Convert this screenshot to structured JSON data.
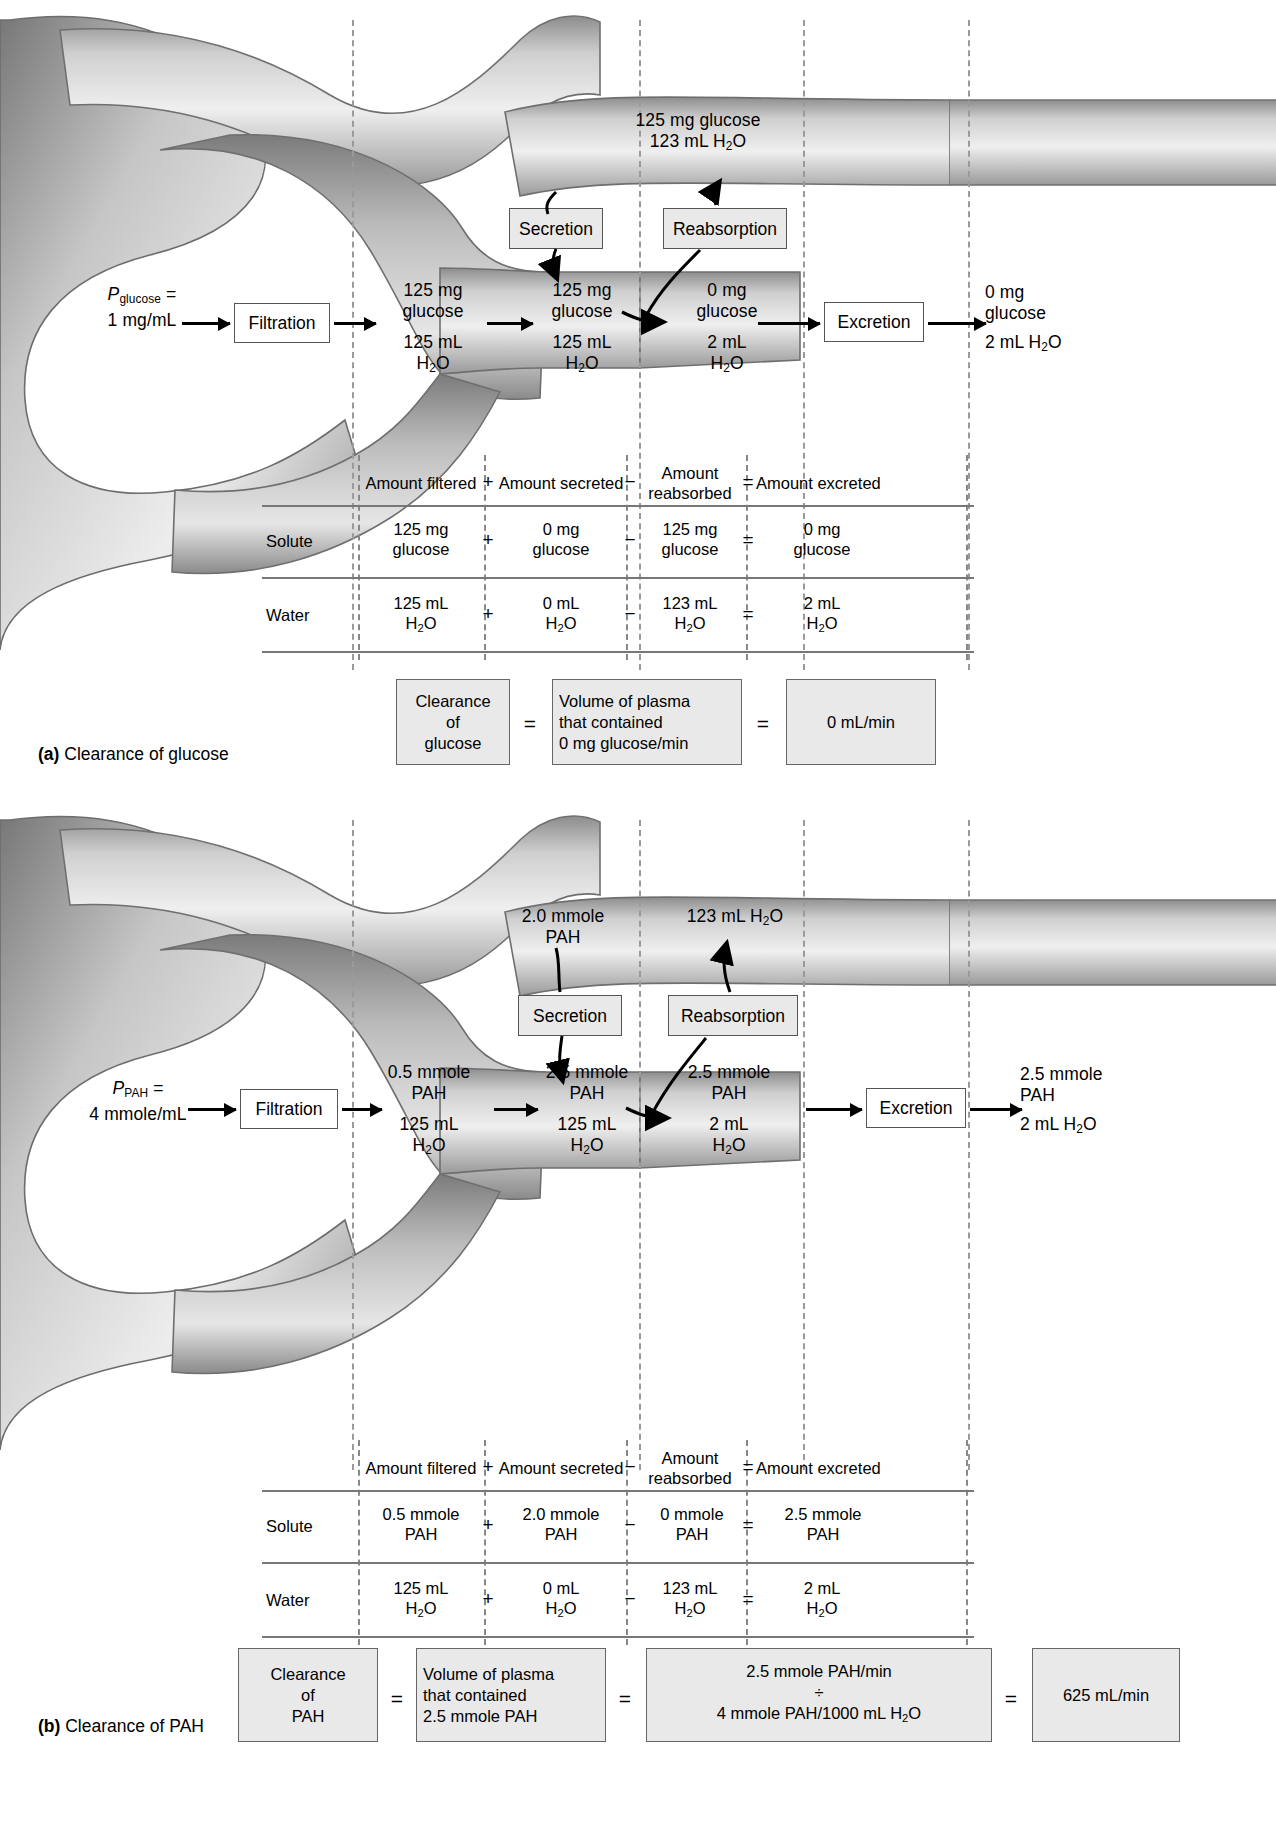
{
  "figure": {
    "type": "renal-clearance-diagram",
    "panels": [
      "a",
      "b"
    ]
  },
  "panel_a": {
    "caption_tag": "(a)",
    "caption_text": "Clearance of glucose",
    "plasma": {
      "symbol": "P",
      "subscript": "glucose",
      "equals": "=",
      "value": "1 mg/mL"
    },
    "process_boxes": {
      "filtration": "Filtration",
      "secretion": "Secretion",
      "reabsorption": "Reabsorption",
      "excretion": "Excretion"
    },
    "capillary_label": {
      "solute": "125 mg glucose",
      "water_pre": "123 mL H",
      "water_sub": "2",
      "water_post": "O"
    },
    "tubule_stages": [
      {
        "solute_amount": "125 mg",
        "solute_name": "glucose",
        "water_amount": "125 mL",
        "water_formula": "H2O"
      },
      {
        "solute_amount": "125 mg",
        "solute_name": "glucose",
        "water_amount": "125 mL",
        "water_formula": "H2O"
      },
      {
        "solute_amount": "0 mg",
        "solute_name": "glucose",
        "water_amount": "2 mL",
        "water_formula": "H2O"
      }
    ],
    "excreted": {
      "solute_amount": "0 mg",
      "solute_name": "glucose",
      "water": "2 mL H2O"
    },
    "table": {
      "headers": [
        "Amount filtered",
        "Amount secreted",
        "Amount\nreabsorbed",
        "Amount excreted"
      ],
      "header_filtered": "Amount filtered",
      "header_secreted": "Amount secreted",
      "header_reabsorbed_l1": "Amount",
      "header_reabsorbed_l2": "reabsorbed",
      "header_excreted": "Amount excreted",
      "operators": [
        "+",
        "−",
        "="
      ],
      "rows": [
        {
          "label": "Solute",
          "filtered_l1": "125 mg",
          "filtered_l2": "glucose",
          "secreted_l1": "0 mg",
          "secreted_l2": "glucose",
          "reabsorbed_l1": "125 mg",
          "reabsorbed_l2": "glucose",
          "excreted_l1": "0 mg",
          "excreted_l2": "glucose"
        },
        {
          "label": "Water",
          "filtered_l1": "125 mL",
          "filtered_l2": "H2O",
          "secreted_l1": "0 mL",
          "secreted_l2": "H2O",
          "reabsorbed_l1": "123 mL",
          "reabsorbed_l2": "H2O",
          "excreted_l1": "2 mL",
          "excreted_l2": "H2O"
        }
      ]
    },
    "clearance": {
      "box1_l1": "Clearance",
      "box1_l2": "of",
      "box1_l3": "glucose",
      "eq1": "=",
      "box2_l1": "Volume of plasma",
      "box2_l2": "that contained",
      "box2_l3": "0 mg glucose/min",
      "eq2": "=",
      "box3": "0 mL/min"
    }
  },
  "panel_b": {
    "caption_tag": "(b)",
    "caption_text": "Clearance of PAH",
    "plasma": {
      "symbol": "P",
      "subscript": "PAH",
      "equals": "=",
      "value": "4 mmole/mL"
    },
    "process_boxes": {
      "filtration": "Filtration",
      "secretion": "Secretion",
      "reabsorption": "Reabsorption",
      "excretion": "Excretion"
    },
    "capillary_label": {
      "solute_l1": "2.0 mmole",
      "solute_l2": "PAH",
      "water": "123 mL H2O"
    },
    "tubule_stages": [
      {
        "solute_amount": "0.5 mmole",
        "solute_name": "PAH",
        "water_amount": "125 mL",
        "water_formula": "H2O"
      },
      {
        "solute_amount": "2.5 mmole",
        "solute_name": "PAH",
        "water_amount": "125 mL",
        "water_formula": "H2O"
      },
      {
        "solute_amount": "2.5 mmole",
        "solute_name": "PAH",
        "water_amount": "2 mL",
        "water_formula": "H2O"
      }
    ],
    "excreted": {
      "solute_amount": "2.5 mmole",
      "solute_name": "PAH",
      "water": "2 mL H2O"
    },
    "table": {
      "header_filtered": "Amount filtered",
      "header_secreted": "Amount secreted",
      "header_reabsorbed_l1": "Amount",
      "header_reabsorbed_l2": "reabsorbed",
      "header_excreted": "Amount excreted",
      "operators": [
        "+",
        "−",
        "="
      ],
      "rows": [
        {
          "label": "Solute",
          "filtered_l1": "0.5 mmole",
          "filtered_l2": "PAH",
          "secreted_l1": "2.0 mmole",
          "secreted_l2": "PAH",
          "reabsorbed_l1": "0 mmole",
          "reabsorbed_l2": "PAH",
          "excreted_l1": "2.5 mmole",
          "excreted_l2": "PAH"
        },
        {
          "label": "Water",
          "filtered_l1": "125 mL",
          "filtered_l2": "H2O",
          "secreted_l1": "0 mL",
          "secreted_l2": "H2O",
          "reabsorbed_l1": "123 mL",
          "reabsorbed_l2": "H2O",
          "excreted_l1": "2 mL",
          "excreted_l2": "H2O"
        }
      ]
    },
    "clearance": {
      "box1_l1": "Clearance",
      "box1_l2": "of",
      "box1_l3": "PAH",
      "eq1": "=",
      "box2_l1": "Volume of plasma",
      "box2_l2": "that contained",
      "box2_l3": "2.5 mmole PAH",
      "eq2": "=",
      "box3_l1": "2.5 mmole PAH/min",
      "box3_l2": "÷",
      "box3_l3": "4 mmole PAH/1000 mL H2O",
      "eq3": "=",
      "box4": "625 mL/min"
    }
  },
  "colors": {
    "box_fill": "#e9e9e9",
    "box_stroke": "#555555",
    "vessel_light": "#d8d8d8",
    "vessel_mid": "#a8a8a8",
    "vessel_dark": "#6f6f6f",
    "rule": "#777777",
    "dash": "#8d8d8d"
  }
}
